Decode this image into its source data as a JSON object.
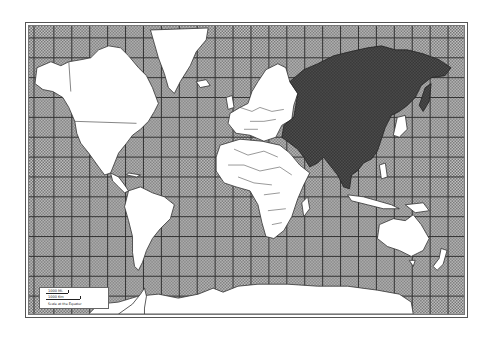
{
  "map": {
    "type": "World political map (Mercator projection)",
    "projection": "Mercator",
    "graticule": {
      "vertical_spacing_px": 18,
      "horizontal_spacing_px": 20,
      "line_color": "#3a3a3a"
    },
    "colors": {
      "ocean_fill": "#9a9a9a",
      "ocean_pattern": "stippled dot pattern",
      "land_fill": "#ffffff",
      "highlight_fill": "#3c3c3c",
      "border_color": "#444444",
      "frame_color": "#555555"
    },
    "highlighted_region": {
      "label": "Asia (incl. Russia, Middle East, South Asia, China, Southeast Asia)",
      "fill": "#3c3c3c"
    },
    "regions": [
      {
        "name": "North America",
        "highlighted": false
      },
      {
        "name": "Greenland",
        "highlighted": false
      },
      {
        "name": "Central America",
        "highlighted": false
      },
      {
        "name": "South America",
        "highlighted": false
      },
      {
        "name": "Europe",
        "highlighted": false
      },
      {
        "name": "Africa",
        "highlighted": false
      },
      {
        "name": "Asia",
        "highlighted": true
      },
      {
        "name": "Australia",
        "highlighted": false
      },
      {
        "name": "New Zealand",
        "highlighted": false
      },
      {
        "name": "Antarctica",
        "highlighted": false
      }
    ],
    "legend": {
      "scale_miles": "1000 Mi.",
      "scale_km": "1000 Km",
      "caption": "Scale at the Equator"
    }
  }
}
